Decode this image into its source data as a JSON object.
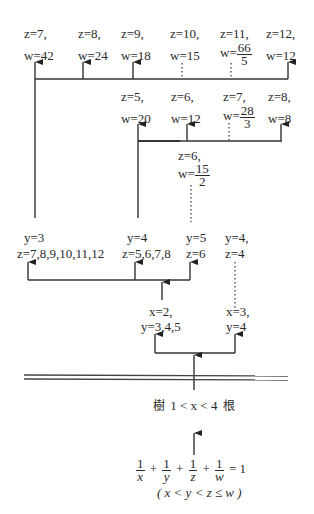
{
  "diagram": {
    "type": "solution tree for unit-fraction equation",
    "root": {
      "equation": {
        "terms": [
          {
            "num": "1",
            "den": "x"
          },
          {
            "num": "1",
            "den": "y"
          },
          {
            "num": "1",
            "den": "z"
          },
          {
            "num": "1",
            "den": "w"
          }
        ],
        "plus": "+",
        "equals": "= 1"
      },
      "constraint": "( x < y < z ≤ w )"
    },
    "bound": {
      "prefix": "樹",
      "text": "1 < x < 4",
      "suffix": "根"
    },
    "level_x": [
      {
        "line1": "x=2,",
        "line2": "y=3,4,5"
      },
      {
        "line1": "x=3,",
        "line2": "y=4"
      }
    ],
    "level_y": [
      {
        "line1": "y=3",
        "line2": "z=7,8,9,10,11,12"
      },
      {
        "line1": "y=4",
        "line2": "z=5,6,7,8"
      },
      {
        "line1": "y=5",
        "line2": "z=6"
      },
      {
        "line1": "y=4,",
        "line2": "z=4"
      }
    ],
    "level_y5": {
      "line1": "z=6,",
      "w_prefix": "w=",
      "w_num": "15",
      "w_den": "2"
    },
    "level_y4": [
      {
        "z": "z=5,",
        "w": "w=20"
      },
      {
        "z": "z=6,",
        "w": "w=12"
      },
      {
        "z": "z=7,",
        "w_prefix": "w=",
        "w_num": "28",
        "w_den": "3"
      },
      {
        "z": "z=8,",
        "w": "w=8"
      }
    ],
    "level_y3": [
      {
        "z": "z=7,",
        "w": "w=42"
      },
      {
        "z": "z=8,",
        "w": "w=24"
      },
      {
        "z": "z=9,",
        "w": "w=18"
      },
      {
        "z": "z=10,",
        "w": "w=15"
      },
      {
        "z": "z=11,",
        "w_prefix": "w=",
        "w_num": "66",
        "w_den": "5"
      },
      {
        "z": "z=12,",
        "w": "w=12"
      }
    ]
  }
}
